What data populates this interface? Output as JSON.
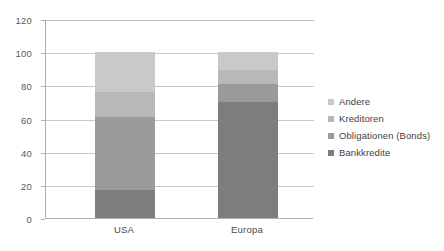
{
  "chart_data": {
    "type": "bar",
    "subtype": "stacked-column",
    "title": "",
    "xlabel": "",
    "ylabel": "",
    "categories": [
      "USA",
      "Europa"
    ],
    "series": [
      {
        "name": "Bankkredite",
        "values": [
          17,
          70
        ],
        "color": "#7d7d7d"
      },
      {
        "name": "Obligationen (Bonds)",
        "values": [
          44,
          11
        ],
        "color": "#9a9a9a"
      },
      {
        "name": "Kreditoren",
        "values": [
          15,
          8
        ],
        "color": "#b8b8b8"
      },
      {
        "name": "Andere",
        "values": [
          24,
          11
        ],
        "color": "#c9c9c9"
      }
    ],
    "stack_totals": [
      100,
      100
    ],
    "ylim": [
      0,
      120
    ],
    "yticks": [
      0,
      20,
      40,
      60,
      80,
      100,
      120
    ],
    "ytick_labels": [
      "0",
      "20",
      "40",
      "60",
      "80",
      "100",
      "120"
    ],
    "grid": true,
    "grid_axis": "y",
    "legend_position": "right",
    "legend_order": [
      "Andere",
      "Kreditoren",
      "Obligationen (Bonds)",
      "Bankkredite"
    ],
    "background_color": "#ffffff",
    "gridline_color": "#c8c8c8",
    "axis_color": "#b0b0b0"
  },
  "legend": {
    "items": [
      {
        "label": "Andere",
        "color": "#c9c9c9"
      },
      {
        "label": "Kreditoren",
        "color": "#b8b8b8"
      },
      {
        "label": "Obligationen (Bonds)",
        "color": "#9a9a9a"
      },
      {
        "label": "Bankkredite",
        "color": "#7d7d7d"
      }
    ]
  }
}
